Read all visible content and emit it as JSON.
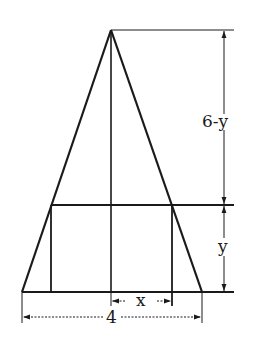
{
  "diagram": {
    "labels": {
      "upper_height": "6-y",
      "rect_height": "y",
      "half_width": "x",
      "base": "4"
    },
    "colors": {
      "stroke": "#1a1a1a",
      "background": "#ffffff"
    }
  }
}
